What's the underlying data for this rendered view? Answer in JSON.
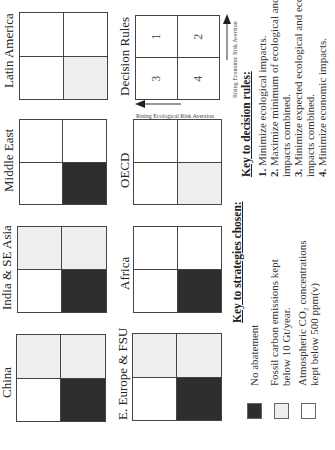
{
  "regions": [
    {
      "name": "Latin America",
      "cells": [
        "white",
        "white",
        "light",
        "white"
      ]
    },
    {
      "name": "Middle East",
      "cells": [
        "white",
        "white",
        "dark",
        "white"
      ]
    },
    {
      "name": "India & SE Asia",
      "cells": [
        "white",
        "light",
        "dark",
        "light"
      ]
    },
    {
      "name": "China",
      "cells": [
        "white",
        "light",
        "dark",
        "light"
      ]
    },
    {
      "name": "OECD",
      "cells": [
        "white",
        "white",
        "light",
        "white"
      ]
    },
    {
      "name": "Africa",
      "cells": [
        "white",
        "white",
        "dark",
        "white"
      ]
    },
    {
      "name": "E. Europe & FSU",
      "cells": [
        "white",
        "light",
        "dark",
        "light"
      ]
    }
  ],
  "decision_rules_panel": {
    "title": "Decision Rules",
    "cells": [
      "3",
      "1",
      "4",
      "2"
    ],
    "x_axis_label": "Rising Economic Risk Aversion",
    "y_axis_label": "Rising Ecological Risk Aversion"
  },
  "decision_key": {
    "title": "Key to decision rules:",
    "lines": [
      {
        "num": "1.",
        "text": " Minimize ecological impacts."
      },
      {
        "num": "2.",
        "text": " Maximize minimum of ecological and economic"
      },
      {
        "num": "",
        "text": "impacts combined."
      },
      {
        "num": "3.",
        "text": " Minimize expected ecological and economic"
      },
      {
        "num": "",
        "text": "impacts combined."
      },
      {
        "num": "4.",
        "text": " Minimize economic impacts."
      }
    ]
  },
  "strategy_key": {
    "title": "Key to strategies chosen:",
    "items": [
      {
        "swatch": "dark",
        "text": "No abatement"
      },
      {
        "swatch": "light",
        "text": "Fossil carbon emissions kept below 10 Gt/year."
      },
      {
        "swatch": "white",
        "text": "Atmospheric CO₂ concentrations kept below 500 ppm(v)"
      }
    ]
  },
  "colors": {
    "dark": "#2e2e2e",
    "light": "#eeeeee",
    "white": "#ffffff",
    "border": "#444444"
  }
}
